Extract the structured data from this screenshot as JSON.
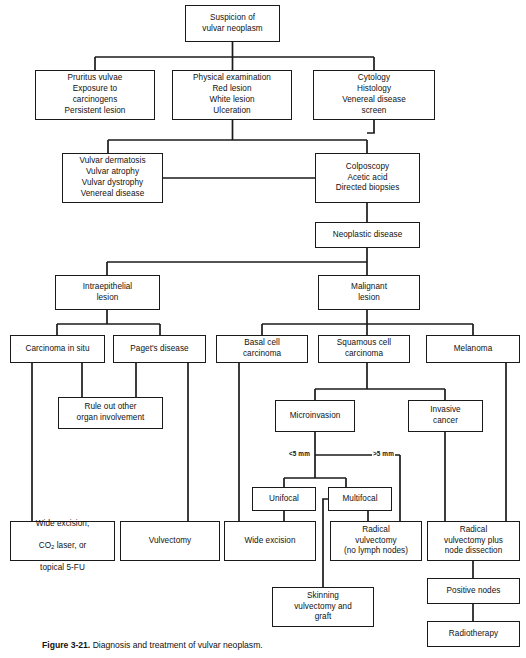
{
  "figure": {
    "caption_label": "Figure 3-21.",
    "caption_text": "Diagnosis and treatment of vulvar neoplasm."
  },
  "nodes": {
    "suspicion": "Suspicion of\nvulvar neoplasm",
    "pruritus": "Pruritus vulvae\nExposure to\ncarcinogens\nPersistent lesion",
    "physical_exam": "Physical examination\nRed lesion\nWhite lesion\nUlceration",
    "cytology": "Cytology\nHistology\nVenereal disease\nscreen",
    "vulvar_dermatosis": "Vulvar dermatosis\nVulvar atrophy\nVulvar dystrophy\nVenereal disease",
    "colposcopy": "Colposcopy\nAcetic acid\nDirected biopsies",
    "neoplastic_disease": "Neoplastic disease",
    "intraepithelial_lesion": "Intraepithelial\nlesion",
    "malignant_lesion": "Malignant\nlesion",
    "carcinoma_in_situ": "Carcinoma in situ",
    "pagets_disease": "Paget's disease",
    "basal_cell": "Basal cell\ncarcinoma",
    "squamous_cell": "Squamous cell\ncarcinoma",
    "melanoma": "Melanoma",
    "rule_out_other": "Rule out other\norgan involvement",
    "microinvasion": "Microinvasion",
    "invasive_cancer": "Invasive\ncancer",
    "unifocal": "Unifocal",
    "multifocal": "Multifocal",
    "wide_excision_laser_line1": "Wide excision,",
    "wide_excision_laser_line2_a": "CO",
    "wide_excision_laser_line2_sub": "2",
    "wide_excision_laser_line2_b": " laser, or",
    "wide_excision_laser_line3": "topical 5-FU",
    "vulvectomy": "Vulvectomy",
    "wide_excision": "Wide excision",
    "radical_vulvectomy": "Radical\nvulvectomy\n(no lymph nodes)",
    "radical_vulvectomy_node": "Radical\nvulvectomy plus\nnode dissection",
    "skinning_vulvectomy": "Skinning\nvulvectomy and\ngraft",
    "positive_nodes": "Positive nodes",
    "radiotherapy": "Radiotherapy"
  },
  "edge_labels": {
    "less_than_5mm": "<5 mm",
    "greater_than_5mm": ">5 mm"
  },
  "style": {
    "line_color": "#1a1a1a",
    "box_fill": "#ffffff",
    "text_color": "#111111"
  }
}
